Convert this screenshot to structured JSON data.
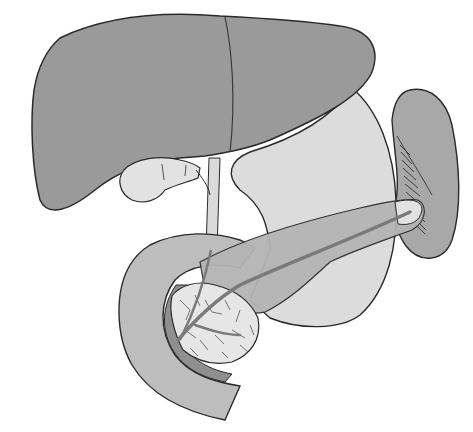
{
  "figure": {
    "title": "Liver, gallbladder, stomach, spleen, pancreas and duodenum (anterior view)",
    "labels": [],
    "organs": [
      {
        "id": "liver",
        "name": "Liver"
      },
      {
        "id": "gallbladder",
        "name": "Gallbladder"
      },
      {
        "id": "bile-duct",
        "name": "Common bile duct"
      },
      {
        "id": "stomach",
        "name": "Stomach"
      },
      {
        "id": "spleen",
        "name": "Spleen"
      },
      {
        "id": "pancreas",
        "name": "Pancreas"
      },
      {
        "id": "pancreatic-duct",
        "name": "Pancreatic duct"
      },
      {
        "id": "duodenum",
        "name": "Duodenum"
      }
    ],
    "colors": {
      "background": "#ffffff",
      "liver": "#9a9a9a",
      "gallbladder": "#e2e2e2",
      "stomach": "#dcdcdc",
      "spleen": "#a8a8a8",
      "pancreas": "#b4b4b4",
      "duodenum": "#bdbdbd",
      "duodenum_inner": "#8f8f8f",
      "pancreas_head": "#e6e6e6",
      "duct": "#7a7a7a",
      "outline": "#2a2a2a"
    }
  }
}
